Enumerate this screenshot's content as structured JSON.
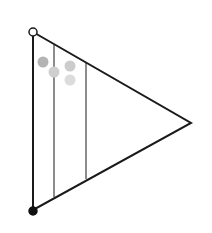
{
  "diagram": {
    "width": 212,
    "height": 233,
    "background": "#ffffff",
    "triangle": {
      "points": [
        [
          33,
          32
        ],
        [
          191,
          123
        ],
        [
          33,
          210
        ]
      ],
      "stroke": "#1a1a1a",
      "stroke_width": 2
    },
    "vertical_lines": [
      {
        "x": 54,
        "y1": 45,
        "y2": 197,
        "stroke": "#8c8c8c"
      },
      {
        "x": 86,
        "y1": 63,
        "y2": 179,
        "stroke": "#8c8c8c"
      }
    ],
    "endpoints": {
      "top": {
        "cx": 33,
        "cy": 32,
        "r": 4,
        "fill": "#ffffff",
        "stroke": "#1a1a1a"
      },
      "bottom": {
        "cx": 33,
        "cy": 211,
        "r": 4,
        "fill": "#111111",
        "stroke": "#111111"
      }
    },
    "dots": [
      {
        "cx": 43,
        "cy": 62,
        "r": 5.5,
        "fill": "#b3b3b3"
      },
      {
        "cx": 54,
        "cy": 72,
        "r": 5.5,
        "fill": "#cfcfcf"
      },
      {
        "cx": 70,
        "cy": 66,
        "r": 5.5,
        "fill": "#cccccc"
      },
      {
        "cx": 70,
        "cy": 80,
        "r": 5.5,
        "fill": "#dcdcdc"
      }
    ]
  }
}
